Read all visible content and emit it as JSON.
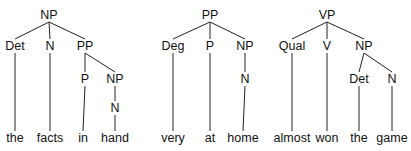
{
  "trees": [
    {
      "name": "tree-np-the-facts-in-hand",
      "root": {
        "label": "NP",
        "x": 49,
        "y": 19
      },
      "nodes": [
        {
          "id": "det",
          "label": "Det",
          "x": 15,
          "y": 50,
          "parent": "root"
        },
        {
          "id": "n",
          "label": "N",
          "x": 50,
          "y": 50,
          "parent": "root"
        },
        {
          "id": "pp",
          "label": "PP",
          "x": 85,
          "y": 50,
          "parent": "root"
        },
        {
          "id": "p",
          "label": "P",
          "x": 85,
          "y": 83,
          "parent": "pp"
        },
        {
          "id": "np2",
          "label": "NP",
          "x": 115,
          "y": 83,
          "parent": "pp"
        },
        {
          "id": "n2",
          "label": "N",
          "x": 115,
          "y": 112,
          "parent": "np2"
        }
      ],
      "words": [
        {
          "text": "the",
          "x": 15,
          "parent": "det"
        },
        {
          "text": "facts",
          "x": 50,
          "parent": "n"
        },
        {
          "text": "in",
          "x": 83,
          "parent": "p"
        },
        {
          "text": "hand",
          "x": 115,
          "parent": "n2"
        }
      ]
    },
    {
      "name": "tree-pp-very-at-home",
      "root": {
        "label": "PP",
        "x": 210,
        "y": 19
      },
      "nodes": [
        {
          "id": "deg",
          "label": "Deg",
          "x": 173,
          "y": 50,
          "parent": "root"
        },
        {
          "id": "p",
          "label": "P",
          "x": 210,
          "y": 50,
          "parent": "root"
        },
        {
          "id": "np",
          "label": "NP",
          "x": 245,
          "y": 50,
          "parent": "root"
        },
        {
          "id": "n",
          "label": "N",
          "x": 245,
          "y": 83,
          "parent": "np"
        }
      ],
      "words": [
        {
          "text": "very",
          "x": 173,
          "parent": "deg"
        },
        {
          "text": "at",
          "x": 210,
          "parent": "p"
        },
        {
          "text": "home",
          "x": 243,
          "parent": "n"
        }
      ]
    },
    {
      "name": "tree-vp-almost-won-the-game",
      "root": {
        "label": "VP",
        "x": 327,
        "y": 19
      },
      "nodes": [
        {
          "id": "qual",
          "label": "Qual",
          "x": 292,
          "y": 50,
          "parent": "root"
        },
        {
          "id": "v",
          "label": "V",
          "x": 327,
          "y": 50,
          "parent": "root"
        },
        {
          "id": "np",
          "label": "NP",
          "x": 364,
          "y": 50,
          "parent": "root"
        },
        {
          "id": "det",
          "label": "Det",
          "x": 359,
          "y": 83,
          "parent": "np"
        },
        {
          "id": "n",
          "label": "N",
          "x": 392,
          "y": 83,
          "parent": "np"
        }
      ],
      "words": [
        {
          "text": "almost",
          "x": 292,
          "parent": "qual"
        },
        {
          "text": "won",
          "x": 327,
          "parent": "v"
        },
        {
          "text": "the",
          "x": 359,
          "parent": "det"
        },
        {
          "text": "game",
          "x": 392,
          "parent": "n"
        }
      ]
    }
  ],
  "word_baseline_y": 142
}
